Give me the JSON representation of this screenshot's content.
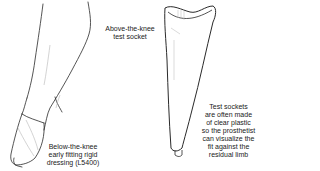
{
  "figure": {
    "labels": {
      "below_knee": [
        "Below-the-knee",
        "early fitting rigid",
        "dressing (L5400)"
      ],
      "above_knee": [
        "Above-the-knee",
        "test socket"
      ],
      "note": [
        "Test sockets",
        "are often made",
        "of clear plastic",
        "so the prosthetist",
        "can visualize the",
        "fit against the",
        "residual limb"
      ]
    },
    "colors": {
      "line": "#2a2a2a",
      "faint": "#b5b5b5",
      "background": "#ffffff"
    }
  }
}
